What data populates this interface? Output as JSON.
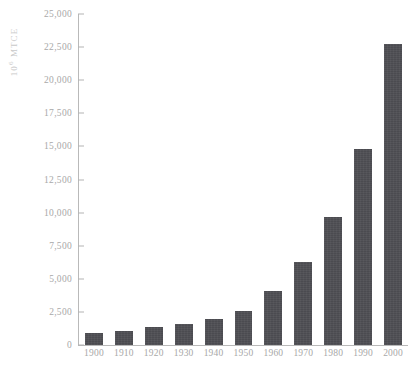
{
  "chart_data": {
    "type": "bar",
    "title": "",
    "subtitle": "",
    "xlabel": "",
    "ylabel": "10⁶ MTCE",
    "ylabel_base": "10",
    "ylabel_exp": "6",
    "ylabel_unit": "MTCE",
    "categories": [
      "1900",
      "1910",
      "1920",
      "1930",
      "1940",
      "1950",
      "1960",
      "1970",
      "1980",
      "1990",
      "2000"
    ],
    "values": [
      900,
      1050,
      1350,
      1550,
      1950,
      2600,
      4100,
      6300,
      9650,
      14800,
      22700
    ],
    "series": [
      {
        "name": "Carbon emissions",
        "values": [
          900,
          1050,
          1350,
          1550,
          1950,
          2600,
          4100,
          6300,
          9650,
          14800,
          22700
        ]
      }
    ],
    "ylim": [
      0,
      25000
    ],
    "xlim_categories": 11,
    "y_ticks": [
      0,
      2500,
      5000,
      7500,
      10000,
      12500,
      15000,
      17500,
      20000,
      22500,
      25000
    ],
    "y_tick_labels": [
      "0",
      "2,500",
      "5,000",
      "7,500",
      "10,000",
      "12,500",
      "15,000",
      "17,500",
      "20,000",
      "22,500",
      "25,000"
    ],
    "grid": false,
    "legend": null,
    "legend_position": "none",
    "annotations": [],
    "bar_color": "#4b4b50",
    "axis_color": "#b9b9b9",
    "text_color": "#a8a8a8",
    "background_color": "#ffffff"
  }
}
